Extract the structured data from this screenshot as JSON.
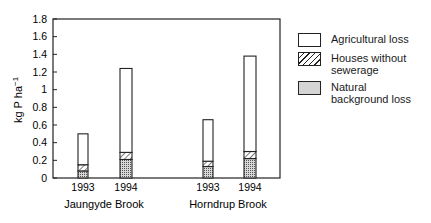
{
  "chart_data": {
    "type": "bar",
    "stacked": true,
    "title": "",
    "xlabel": "",
    "ylabel": "kg P ha⁻¹",
    "ylim": [
      0,
      1.8
    ],
    "yticks": [
      "0",
      "0.2",
      "0.4",
      "0.6",
      "0.8",
      "1",
      "1.2",
      "1.4",
      "1.6",
      "1.8"
    ],
    "grid": false,
    "legend_position": "right",
    "groups": [
      {
        "name": "Jaungyde Brook",
        "categories": [
          "1993",
          "1994"
        ]
      },
      {
        "name": "Horndrup Brook",
        "categories": [
          "1993",
          "1994"
        ]
      }
    ],
    "categories": [
      "Jaungyde Brook 1993",
      "Jaungyde Brook 1994",
      "Horndrup Brook 1993",
      "Horndrup Brook 1994"
    ],
    "series": [
      {
        "name": "Natural background loss",
        "pattern": "dotted",
        "values": [
          0.08,
          0.21,
          0.13,
          0.22
        ]
      },
      {
        "name": "Houses without sewerage",
        "pattern": "hatched",
        "values": [
          0.07,
          0.08,
          0.06,
          0.08
        ]
      },
      {
        "name": "Agricultural loss",
        "pattern": "blank",
        "values": [
          0.35,
          0.95,
          0.47,
          1.08
        ]
      }
    ],
    "totals": [
      0.5,
      1.24,
      0.66,
      1.38
    ]
  },
  "legend": {
    "items": [
      {
        "label": "Agricultural loss",
        "key": "agri"
      },
      {
        "label": "Houses without sewerage",
        "key": "house"
      },
      {
        "label": "Natural background loss",
        "key": "nat"
      }
    ]
  },
  "axis": {
    "ylabel_main": "kg P ha",
    "ylabel_sup": "−1"
  },
  "xaxis": {
    "ticks": [
      "1993",
      "1994",
      "1993",
      "1994"
    ],
    "group_labels": [
      "Jaungyde Brook",
      "Horndrup Brook"
    ]
  }
}
